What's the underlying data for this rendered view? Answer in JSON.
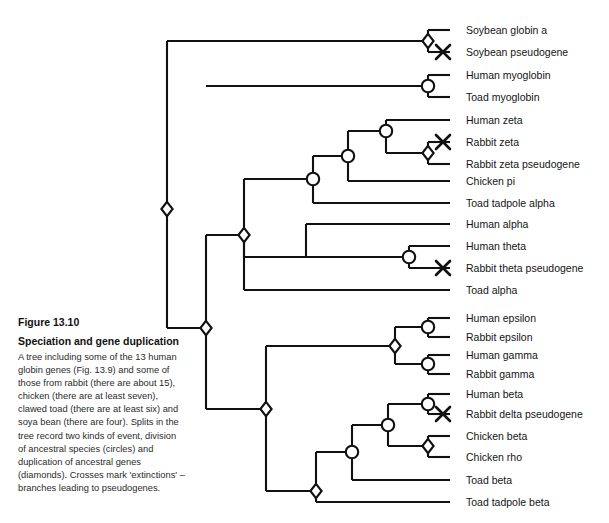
{
  "figure": {
    "number": "Figure 13.10",
    "title": "Speciation and gene duplication",
    "body": "A tree including some of the 13 human globin genes (Fig. 13.9) and some of those from rabbit (there are about 15), chicken (there are at least seven), clawed toad (there are at least six) and soya bean (there are four). Splits in the tree record two kinds of event, division of ancestral species (circles) and duplication of ancestral genes (diamonds). Crosses mark 'extinctions' – branches leading to pseudogenes."
  },
  "style": {
    "line_color": "#111111",
    "node_fill": "#ffffff",
    "background": "#ffffff"
  },
  "legend": {
    "circle_meaning": "division of ancestral species",
    "diamond_meaning": "duplication of ancestral genes",
    "cross_meaning": "extinction - branch leading to pseudogene"
  },
  "chart_data": {
    "type": "diagram",
    "subtype": "phylogenetic-tree",
    "title": "Speciation and gene duplication",
    "leaf_count": 22,
    "leaves": [
      {
        "id": "soybean-globin-a",
        "label": "Soybean globin a",
        "y": 30,
        "tip_x": 450,
        "extinct": false
      },
      {
        "id": "soybean-pseudogene",
        "label": "Soybean pseudogene",
        "y": 52,
        "tip_x": 450,
        "extinct": true
      },
      {
        "id": "human-myoglobin",
        "label": "Human myoglobin",
        "y": 75,
        "tip_x": 450,
        "extinct": false
      },
      {
        "id": "toad-myoglobin",
        "label": "Toad myoglobin",
        "y": 97,
        "tip_x": 450,
        "extinct": false
      },
      {
        "id": "human-zeta",
        "label": "Human zeta",
        "y": 120,
        "tip_x": 450,
        "extinct": false
      },
      {
        "id": "rabbit-zeta",
        "label": "Rabbit zeta",
        "y": 142,
        "tip_x": 450,
        "extinct": true
      },
      {
        "id": "rabbit-zeta-pseudogene",
        "label": "Rabbit zeta pseudogene",
        "y": 164,
        "tip_x": 450,
        "extinct": false
      },
      {
        "id": "chicken-pi",
        "label": "Chicken pi",
        "y": 181,
        "tip_x": 450,
        "extinct": false
      },
      {
        "id": "toad-tadpole-alpha",
        "label": "Toad tadpole alpha",
        "y": 203,
        "tip_x": 450,
        "extinct": false
      },
      {
        "id": "human-alpha",
        "label": "Human alpha",
        "y": 224,
        "tip_x": 450,
        "extinct": false
      },
      {
        "id": "human-theta",
        "label": "Human theta",
        "y": 246,
        "tip_x": 450,
        "extinct": false
      },
      {
        "id": "rabbit-theta-pseudogene",
        "label": "Rabbit theta pseudogene",
        "y": 268,
        "tip_x": 450,
        "extinct": true
      },
      {
        "id": "toad-alpha",
        "label": "Toad alpha",
        "y": 290,
        "tip_x": 450,
        "extinct": false
      },
      {
        "id": "human-epsilon",
        "label": "Human epsilon",
        "y": 318,
        "tip_x": 450,
        "extinct": false
      },
      {
        "id": "rabbit-epsilon",
        "label": "Rabbit epsilon",
        "y": 337,
        "tip_x": 450,
        "extinct": false
      },
      {
        "id": "human-gamma",
        "label": "Human gamma",
        "y": 355,
        "tip_x": 450,
        "extinct": false
      },
      {
        "id": "rabbit-gamma",
        "label": "Rabbit gamma",
        "y": 374,
        "tip_x": 450,
        "extinct": false
      },
      {
        "id": "human-beta",
        "label": "Human beta",
        "y": 394,
        "tip_x": 450,
        "extinct": false
      },
      {
        "id": "rabbit-delta-pseudogene",
        "label": "Rabbit delta pseudogene",
        "y": 414,
        "tip_x": 450,
        "extinct": true
      },
      {
        "id": "chicken-beta",
        "label": "Chicken beta",
        "y": 436,
        "tip_x": 450,
        "extinct": false
      },
      {
        "id": "chicken-rho",
        "label": "Chicken rho",
        "y": 457,
        "tip_x": 450,
        "extinct": false
      },
      {
        "id": "toad-beta",
        "label": "Toad beta",
        "y": 480,
        "tip_x": 450,
        "extinct": false
      },
      {
        "id": "toad-tadpole-beta",
        "label": "Toad tadpole beta",
        "y": 502,
        "tip_x": 450,
        "extinct": false
      }
    ],
    "nodes": [
      {
        "id": "n-soy-dup",
        "shape": "diamond",
        "x": 428,
        "y": 41,
        "name": "soybean-duplication"
      },
      {
        "id": "n-myo",
        "shape": "circle",
        "x": 428,
        "y": 86,
        "name": "myoglobin-speciation"
      },
      {
        "id": "n-rabzeta-dup",
        "shape": "diamond",
        "x": 428,
        "y": 153,
        "name": "rabbit-zeta-duplication"
      },
      {
        "id": "n-zeta-spec",
        "shape": "circle",
        "x": 386,
        "y": 131,
        "name": "zeta-speciation"
      },
      {
        "id": "n-zeta-pi",
        "shape": "circle",
        "x": 348,
        "y": 156,
        "name": "zeta-pi-speciation"
      },
      {
        "id": "n-alphagrp-spec",
        "shape": "circle",
        "x": 313,
        "y": 179,
        "name": "alpha-group-speciation"
      },
      {
        "id": "n-theta-spec",
        "shape": "circle",
        "x": 409,
        "y": 257,
        "name": "theta-speciation"
      },
      {
        "id": "n-alpha-theta",
        "shape": "diamond",
        "x": 244,
        "y": 235,
        "name": "alpha-theta-duplication"
      },
      {
        "id": "n-alpha-clade",
        "shape": "diamond",
        "x": 206,
        "y": 328,
        "name": "root-duplication"
      },
      {
        "id": "n-anc-dup",
        "shape": "diamond",
        "x": 167,
        "y": 209,
        "name": "ancestral-globin-duplication"
      },
      {
        "id": "n-eps-spec",
        "shape": "circle",
        "x": 428,
        "y": 327,
        "name": "epsilon-speciation"
      },
      {
        "id": "n-gam-spec",
        "shape": "circle",
        "x": 428,
        "y": 364,
        "name": "gamma-speciation"
      },
      {
        "id": "n-epsgam-dup",
        "shape": "diamond",
        "x": 395,
        "y": 346,
        "name": "epsilon-gamma-duplication"
      },
      {
        "id": "n-beta-delta",
        "shape": "circle",
        "x": 428,
        "y": 404,
        "name": "beta-delta-speciation"
      },
      {
        "id": "n-chick-dup",
        "shape": "diamond",
        "x": 428,
        "y": 446,
        "name": "chicken-beta-duplication"
      },
      {
        "id": "n-beta-chick",
        "shape": "circle",
        "x": 388,
        "y": 425,
        "name": "beta-chicken-speciation"
      },
      {
        "id": "n-beta-toad",
        "shape": "circle",
        "x": 352,
        "y": 452,
        "name": "beta-toad-speciation"
      },
      {
        "id": "n-beta-tad",
        "shape": "diamond",
        "x": 316,
        "y": 491,
        "name": "toad-beta-duplication"
      },
      {
        "id": "n-beta-clade",
        "shape": "diamond",
        "x": 266,
        "y": 409,
        "name": "beta-clade-duplication"
      }
    ],
    "crosses": [
      {
        "x": 443,
        "y": 52,
        "leaf": "soybean-pseudogene"
      },
      {
        "x": 443,
        "y": 142,
        "leaf": "rabbit-zeta"
      },
      {
        "x": 443,
        "y": 268,
        "leaf": "rabbit-theta-pseudogene"
      },
      {
        "x": 443,
        "y": 414,
        "leaf": "rabbit-delta-pseudogene"
      }
    ]
  }
}
